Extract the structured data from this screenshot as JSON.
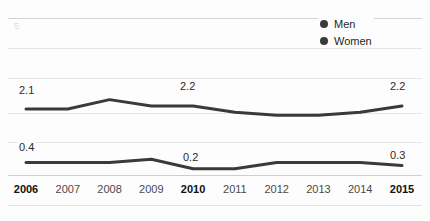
{
  "chart_data": {
    "type": "line",
    "title": "",
    "xlabel": "",
    "ylabel": "",
    "categories": [
      "2006",
      "2007",
      "2008",
      "2009",
      "2010",
      "2011",
      "2012",
      "2013",
      "2014",
      "2015"
    ],
    "ylim": [
      0,
      5
    ],
    "grid": true,
    "legend_position": "top-right",
    "yticks": [
      "5"
    ],
    "series": [
      {
        "name": "Men",
        "color": "#3a3a3a",
        "values": [
          2.1,
          2.1,
          2.4,
          2.2,
          2.2,
          2.0,
          1.9,
          1.9,
          2.0,
          2.2
        ],
        "point_labels": [
          {
            "index": 0,
            "text": "2.1"
          },
          {
            "index": 4,
            "text": "2.2"
          },
          {
            "index": 9,
            "text": "2.2"
          }
        ]
      },
      {
        "name": "Women",
        "color": "#3a3a3a",
        "values": [
          0.4,
          0.4,
          0.4,
          0.5,
          0.2,
          0.2,
          0.4,
          0.4,
          0.4,
          0.3
        ],
        "point_labels": [
          {
            "index": 0,
            "text": "0.4"
          },
          {
            "index": 4,
            "text": "0.2"
          },
          {
            "index": 9,
            "text": "0.3"
          }
        ]
      }
    ]
  },
  "legend": {
    "items": [
      {
        "label": "Men",
        "marker": "circle-marker",
        "color": "#3a3a3a"
      },
      {
        "label": "Women",
        "marker": "circle-marker",
        "color": "#3a3a3a"
      }
    ]
  },
  "axis": {
    "y_top_tick": "5",
    "x_labels": [
      {
        "text": "2006",
        "bold": true
      },
      {
        "text": "2007",
        "bold": false
      },
      {
        "text": "2008",
        "bold": false
      },
      {
        "text": "2009",
        "bold": false
      },
      {
        "text": "2010",
        "bold": true
      },
      {
        "text": "2011",
        "bold": false
      },
      {
        "text": "2012",
        "bold": false
      },
      {
        "text": "2013",
        "bold": false
      },
      {
        "text": "2014",
        "bold": false
      },
      {
        "text": "2015",
        "bold": true
      }
    ]
  },
  "labels": {
    "men_start": "2.1",
    "men_mid": "2.2",
    "men_end": "2.2",
    "women_start": "0.4",
    "women_mid": "0.2",
    "women_end": "0.3"
  }
}
